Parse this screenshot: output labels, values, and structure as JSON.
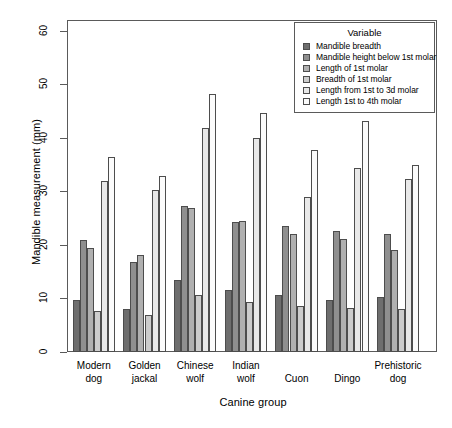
{
  "chart_data": {
    "type": "bar",
    "title": "",
    "xlabel": "Canine group",
    "ylabel": "Mandible measurement (mm)",
    "categories": [
      "Modern\ndog",
      "Golden\njackal",
      "Chinese\nwolf",
      "Indian\nwolf",
      "Cuon",
      "Dingo",
      "Prehistoric\ndog"
    ],
    "ylim": [
      0,
      62
    ],
    "yticks": [
      0,
      10,
      20,
      30,
      40,
      50,
      60
    ],
    "ytick_labels": [
      "0",
      "10",
      "20",
      "30",
      "40",
      "50",
      "60"
    ],
    "grid": false,
    "legend_position": "top-right",
    "legend_title": "Variable",
    "series": [
      {
        "name": "Mandible breadth",
        "color": "#6e6e6e",
        "values": [
          9.7,
          8.1,
          13.5,
          11.5,
          10.7,
          9.7,
          10.3
        ]
      },
      {
        "name": "Mandible height below 1st molar",
        "color": "#8f8f8f",
        "values": [
          21.0,
          16.9,
          27.3,
          24.3,
          23.5,
          22.6,
          22.1
        ]
      },
      {
        "name": "Length of 1st molar",
        "color": "#b0b0b0",
        "values": [
          19.4,
          18.1,
          26.8,
          24.5,
          22.0,
          21.1,
          19.1
        ]
      },
      {
        "name": "Breadth of 1st molar",
        "color": "#cccccc",
        "values": [
          7.7,
          7.0,
          10.6,
          9.3,
          8.6,
          8.3,
          8.1
        ]
      },
      {
        "name": "Length from 1st to 3d molar",
        "color": "#e8e8e8",
        "values": [
          32.0,
          30.3,
          41.9,
          40.0,
          29.0,
          34.4,
          32.3
        ]
      },
      {
        "name": "Length 1st to 4th molar",
        "color": "#fbfbfb",
        "values": [
          36.5,
          32.9,
          48.1,
          44.6,
          37.8,
          43.1,
          35.0
        ]
      }
    ]
  }
}
